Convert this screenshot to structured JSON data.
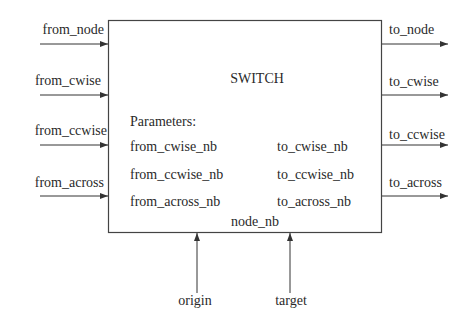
{
  "block": {
    "title": "SWITCH",
    "parameters_heading": "Parameters:",
    "parameters_left": [
      "from_cwise_nb",
      "from_ccwise_nb",
      "from_across_nb"
    ],
    "parameters_right": [
      "to_cwise_nb",
      "to_ccwise_nb",
      "to_across_nb"
    ],
    "parameter_bottom": "node_nb"
  },
  "inputs": [
    {
      "label": "from_node"
    },
    {
      "label": "from_cwise"
    },
    {
      "label": "from_ccwise"
    },
    {
      "label": "from_across"
    }
  ],
  "outputs": [
    {
      "label": "to_node"
    },
    {
      "label": "to_cwise"
    },
    {
      "label": "to_ccwise"
    },
    {
      "label": "to_across"
    }
  ],
  "bottom_inputs": [
    {
      "label": "origin"
    },
    {
      "label": "target"
    }
  ],
  "colors": {
    "line": "#333333",
    "background": "#ffffff"
  }
}
